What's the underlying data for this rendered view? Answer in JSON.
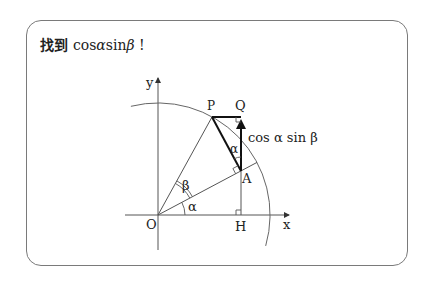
{
  "title": {
    "prefix": "找到 ",
    "cos": "cos",
    "alpha": "α",
    "sin": "sin",
    "beta": "β",
    "suffix": " !"
  },
  "diagram": {
    "axis_labels": {
      "y": "y",
      "x": "x"
    },
    "points": {
      "O": "O",
      "P": "P",
      "Q": "Q",
      "A": "A",
      "H": "H"
    },
    "angles": {
      "alpha_at_O": "α",
      "beta_at_O": "β",
      "alpha_at_A": "α"
    },
    "segment_label": "cos α sin β"
  },
  "colors": {
    "line": "#555555",
    "bold_line": "#222222",
    "border": "#7a7a7a"
  }
}
